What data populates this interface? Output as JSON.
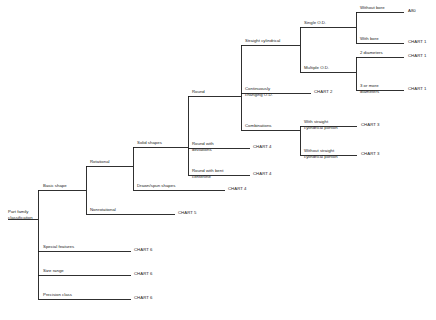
{
  "diagram": {
    "line_color": "#1a1a1a",
    "text_color": "#1a1a1a",
    "background": "#ffffff",
    "root": {
      "label": "Part family\nclassification"
    },
    "nodes": {
      "basic_shape": "Basic shape",
      "special_features": "Special features",
      "size_range": "Size range",
      "precision_class": "Precision class",
      "rotational": "Rotational",
      "nonrotational": "Nonrotational",
      "solid_shapes": "Solid shapes",
      "drawn_spun_shapes": "Drawn/spun shapes",
      "round": "Round",
      "round_with_deviations": "Round with\ndeviations",
      "round_with_bent_centerline": "Round with bent\ncenterline",
      "straight_cylindrical": "Straight cylindrical",
      "continuously_changing_od": "Continuously\nchanging O.D.",
      "combinations": "Combinations",
      "single_od": "Single O.D.",
      "multiple_od": "Multiple O.D.",
      "without_bore": "Without bore",
      "with_bore": "With bore",
      "two_diameters": "2 diameters",
      "three_or_more_diameters": "3 or more\ndiameters",
      "with_straight_cylindrical_portion": "With straight\ncylindrical portion",
      "without_straight_cylindrical_portion": "Without straight\ncylindrical portion"
    },
    "leaves": {
      "without_bore_ref": "A80",
      "with_bore_ref": "CHART 1",
      "two_diameters_ref": "CHART 1",
      "three_or_more_diameters_ref": "CHART 1",
      "continuously_changing_od_ref": "CHART 2",
      "with_straight_cyl_ref": "CHART 3",
      "without_straight_cyl_ref": "CHART 3",
      "round_with_deviations_ref": "CHART 4",
      "round_with_bent_centerline_ref": "CHART 4",
      "drawn_spun_shapes_ref": "CHART 4",
      "nonrotational_ref": "CHART 5",
      "special_features_ref": "CHART 6",
      "size_range_ref": "CHART 6",
      "precision_class_ref": "CHART 6"
    }
  }
}
